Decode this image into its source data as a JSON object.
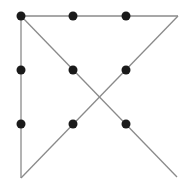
{
  "diagram": {
    "line_color": "#8a8a8a",
    "dot_color": "#1a1a1a",
    "dot_radius": 4.5,
    "dots": [
      {
        "x": 21,
        "y": 16
      },
      {
        "x": 73,
        "y": 16
      },
      {
        "x": 126,
        "y": 16
      },
      {
        "x": 21,
        "y": 70
      },
      {
        "x": 73,
        "y": 70
      },
      {
        "x": 126,
        "y": 70
      },
      {
        "x": 21,
        "y": 124
      },
      {
        "x": 73,
        "y": 124
      },
      {
        "x": 126,
        "y": 124
      }
    ],
    "lines": [
      {
        "x1": 21,
        "y1": 16,
        "x2": 178,
        "y2": 16
      },
      {
        "x1": 178,
        "y1": 16,
        "x2": 21,
        "y2": 178
      },
      {
        "x1": 21,
        "y1": 178,
        "x2": 21,
        "y2": 16
      },
      {
        "x1": 21,
        "y1": 16,
        "x2": 177,
        "y2": 177
      }
    ]
  }
}
